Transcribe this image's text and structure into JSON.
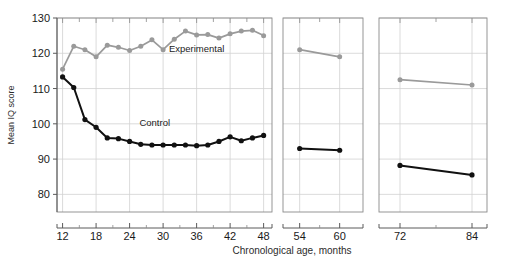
{
  "chart_data": {
    "type": "line",
    "title": "",
    "xlabel": "Chronological age, months",
    "ylabel": "Mean IQ score",
    "ylim": [
      75,
      130
    ],
    "yticks": [
      80,
      90,
      100,
      110,
      120,
      130
    ],
    "grid": true,
    "legend_position": "inline-annotation",
    "axis_breaks": [
      [
        48,
        54
      ],
      [
        60,
        72
      ]
    ],
    "xtick_labels": [
      "12",
      "18",
      "24",
      "30",
      "36",
      "42",
      "48",
      "54",
      "60",
      "72",
      "84"
    ],
    "xticks": [
      12,
      18,
      24,
      30,
      36,
      42,
      48,
      54,
      60,
      72,
      84
    ],
    "minor_xticks": [
      15,
      21,
      27,
      33,
      39,
      45,
      51,
      57,
      66,
      78
    ],
    "annotations": [
      {
        "text": "Experimental",
        "x": 36,
        "y": 120.5
      },
      {
        "text": "Control",
        "x": 28.5,
        "y": 99.5
      }
    ],
    "series": [
      {
        "name": "Experimental",
        "color": "#9a9a9a",
        "x": [
          12,
          14,
          16,
          18,
          20,
          22,
          24,
          26,
          28,
          30,
          32,
          34,
          36,
          38,
          40,
          42,
          44,
          46,
          48,
          54,
          60,
          72,
          84
        ],
        "values": [
          115.5,
          122.0,
          121.0,
          119.0,
          122.3,
          121.7,
          120.8,
          122.0,
          123.8,
          121.0,
          124.0,
          126.3,
          125.2,
          125.3,
          124.3,
          125.5,
          126.3,
          126.5,
          125.0,
          121.0,
          119.0,
          112.5,
          111.0
        ]
      },
      {
        "name": "Control",
        "color": "#111111",
        "x": [
          12,
          14,
          16,
          18,
          20,
          22,
          24,
          26,
          28,
          30,
          32,
          34,
          36,
          38,
          40,
          42,
          44,
          46,
          48,
          54,
          60,
          72,
          84
        ],
        "values": [
          113.3,
          110.3,
          101.2,
          99.0,
          96.0,
          95.8,
          95.0,
          94.2,
          94.0,
          94.0,
          94.0,
          94.0,
          93.8,
          94.0,
          95.0,
          96.3,
          95.2,
          96.0,
          96.7,
          93.0,
          92.5,
          88.2,
          85.5
        ]
      }
    ]
  }
}
